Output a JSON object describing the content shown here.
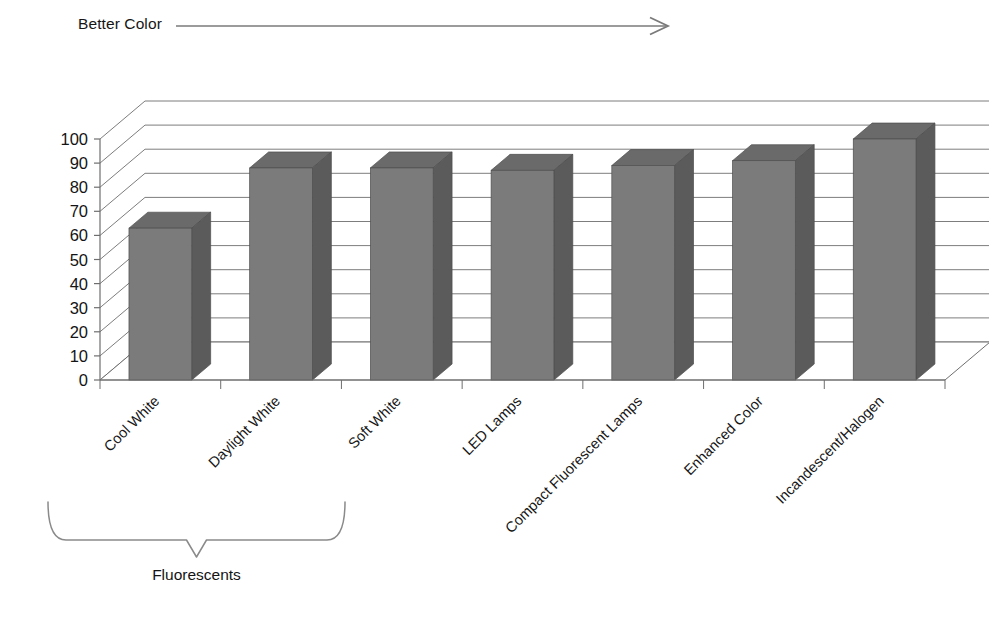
{
  "annotations": {
    "top_arrow_label": "Better Color",
    "group_bracket_label": "Fluorescents"
  },
  "colors": {
    "bar_front": "#7b7b7b",
    "bar_side": "#5b5b5b",
    "bar_top": "#6a6a6a",
    "gridline": "#7d7d7d",
    "axis": "#6e6e6e",
    "text": "#161616",
    "background": "#ffffff"
  },
  "axis": {
    "y_ticks": [
      "100",
      "90",
      "80",
      "70",
      "60",
      "50",
      "40",
      "30",
      "20",
      "10",
      "0"
    ],
    "y_min": 0,
    "y_max": 100,
    "y_step": 10
  },
  "chart_data": {
    "type": "bar",
    "title": "",
    "subtitle": "",
    "xlabel": "",
    "ylabel": "",
    "ylim": [
      0,
      100
    ],
    "ytick_step": 10,
    "grid": true,
    "legend": "none",
    "three_d": true,
    "categories": [
      "Cool White",
      "Daylight White",
      "Soft White",
      "LED Lamps",
      "Compact Fluorescent Lamps",
      "Enhanced Color",
      "Incandescent/Halogen"
    ],
    "values": [
      63,
      88,
      88,
      87,
      89,
      91,
      100
    ],
    "annotations": [
      {
        "text": "Better Color",
        "type": "arrow-right",
        "position": "top-left-spanning-right"
      },
      {
        "text": "Fluorescents",
        "type": "brace-under-categories",
        "covers": [
          "Cool White",
          "Daylight White",
          "Soft White"
        ]
      }
    ]
  }
}
